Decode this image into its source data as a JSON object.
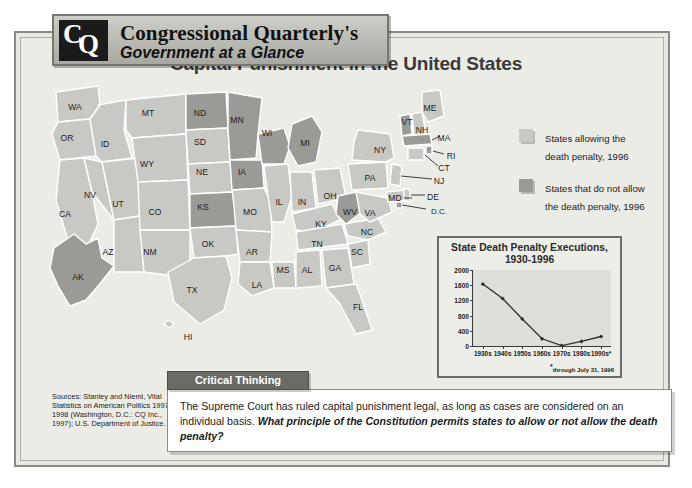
{
  "header": {
    "logo_c": "C",
    "logo_q": "Q",
    "line1": "Congressional Quarterly's",
    "line2": "Government at a Glance"
  },
  "main_title": "Capital Punishment in the United States",
  "legend": {
    "items": [
      {
        "swatch": "light",
        "text": "States allowing the death penalty, 1996",
        "color": "#c8c8c4"
      },
      {
        "swatch": "dark",
        "text": "States that do not allow the death penalty, 1996",
        "color": "#9a9a96"
      }
    ]
  },
  "map": {
    "allow_color": "#c8c8c4",
    "disallow_color": "#9a9a96",
    "border_color": "#ffffff",
    "states": [
      {
        "abbr": "WA",
        "x": 35,
        "y": 35,
        "penalty": "allow"
      },
      {
        "abbr": "OR",
        "x": 27,
        "y": 66,
        "penalty": "allow"
      },
      {
        "abbr": "CA",
        "x": 25,
        "y": 142,
        "penalty": "allow"
      },
      {
        "abbr": "ID",
        "x": 65,
        "y": 72,
        "penalty": "allow"
      },
      {
        "abbr": "NV",
        "x": 50,
        "y": 123,
        "penalty": "allow"
      },
      {
        "abbr": "UT",
        "x": 78,
        "y": 132,
        "penalty": "allow"
      },
      {
        "abbr": "AZ",
        "x": 68,
        "y": 180,
        "penalty": "allow"
      },
      {
        "abbr": "MT",
        "x": 108,
        "y": 41,
        "penalty": "allow"
      },
      {
        "abbr": "WY",
        "x": 107,
        "y": 92,
        "penalty": "allow"
      },
      {
        "abbr": "CO",
        "x": 115,
        "y": 140,
        "penalty": "allow"
      },
      {
        "abbr": "NM",
        "x": 110,
        "y": 180,
        "penalty": "allow"
      },
      {
        "abbr": "ND",
        "x": 160,
        "y": 41,
        "penalty": "disallow"
      },
      {
        "abbr": "SD",
        "x": 160,
        "y": 70,
        "penalty": "allow"
      },
      {
        "abbr": "NE",
        "x": 162,
        "y": 100,
        "penalty": "allow"
      },
      {
        "abbr": "KS",
        "x": 163,
        "y": 135,
        "penalty": "disallow"
      },
      {
        "abbr": "OK",
        "x": 168,
        "y": 172,
        "penalty": "allow"
      },
      {
        "abbr": "TX",
        "x": 152,
        "y": 218,
        "penalty": "allow"
      },
      {
        "abbr": "MN",
        "x": 197,
        "y": 48,
        "penalty": "disallow"
      },
      {
        "abbr": "IA",
        "x": 202,
        "y": 100,
        "penalty": "disallow"
      },
      {
        "abbr": "MO",
        "x": 210,
        "y": 140,
        "penalty": "allow"
      },
      {
        "abbr": "AR",
        "x": 212,
        "y": 180,
        "penalty": "allow"
      },
      {
        "abbr": "LA",
        "x": 217,
        "y": 213,
        "penalty": "allow"
      },
      {
        "abbr": "WI",
        "x": 227,
        "y": 61,
        "penalty": "disallow"
      },
      {
        "abbr": "IL",
        "x": 239,
        "y": 130,
        "penalty": "allow"
      },
      {
        "abbr": "MS",
        "x": 243,
        "y": 198,
        "penalty": "allow"
      },
      {
        "abbr": "MI",
        "x": 265,
        "y": 71,
        "penalty": "disallow"
      },
      {
        "abbr": "IN",
        "x": 262,
        "y": 130,
        "penalty": "allow"
      },
      {
        "abbr": "KY",
        "x": 281,
        "y": 152,
        "penalty": "allow"
      },
      {
        "abbr": "TN",
        "x": 277,
        "y": 172,
        "penalty": "allow"
      },
      {
        "abbr": "AL",
        "x": 267,
        "y": 198,
        "penalty": "allow"
      },
      {
        "abbr": "OH",
        "x": 290,
        "y": 124,
        "penalty": "allow"
      },
      {
        "abbr": "GA",
        "x": 295,
        "y": 196,
        "penalty": "allow"
      },
      {
        "abbr": "FL",
        "x": 318,
        "y": 235,
        "penalty": "allow"
      },
      {
        "abbr": "SC",
        "x": 317,
        "y": 180,
        "penalty": "allow"
      },
      {
        "abbr": "NC",
        "x": 327,
        "y": 160,
        "penalty": "allow"
      },
      {
        "abbr": "WV",
        "x": 310,
        "y": 140,
        "penalty": "disallow"
      },
      {
        "abbr": "VA",
        "x": 330,
        "y": 141,
        "penalty": "allow"
      },
      {
        "abbr": "PA",
        "x": 330,
        "y": 106,
        "penalty": "allow"
      },
      {
        "abbr": "NY",
        "x": 340,
        "y": 78,
        "penalty": "allow"
      },
      {
        "abbr": "VT",
        "x": 367,
        "y": 50,
        "penalty": "disallow"
      },
      {
        "abbr": "NH",
        "x": 382,
        "y": 58,
        "penalty": "allow"
      },
      {
        "abbr": "ME",
        "x": 390,
        "y": 36,
        "penalty": "allow"
      },
      {
        "abbr": "MA",
        "x": 404,
        "y": 66,
        "penalty": "disallow"
      },
      {
        "abbr": "RI",
        "x": 410,
        "y": 83,
        "penalty": "disallow"
      },
      {
        "abbr": "CT",
        "x": 404,
        "y": 95,
        "penalty": "allow"
      },
      {
        "abbr": "NJ",
        "x": 398,
        "y": 108,
        "penalty": "allow"
      },
      {
        "abbr": "MD",
        "x": 355,
        "y": 125,
        "penalty": "allow"
      },
      {
        "abbr": "DE",
        "x": 392,
        "y": 124,
        "penalty": "allow"
      },
      {
        "abbr": "D.C.",
        "x": 398,
        "y": 138,
        "penalty": "disallow"
      },
      {
        "abbr": "AK",
        "x": 38,
        "y": 205,
        "penalty": "disallow"
      },
      {
        "abbr": "HI",
        "x": 148,
        "y": 265,
        "penalty": "allow"
      }
    ]
  },
  "chart_data": {
    "type": "line",
    "title": "State Death Penalty Executions, 1930-1996",
    "title_line1": "State Death Penalty Executions,",
    "title_line2": "1930-1996",
    "categories": [
      "1930s",
      "1940s",
      "1950s",
      "1960s",
      "1970s",
      "1980s",
      "1990s"
    ],
    "values": [
      1630,
      1250,
      710,
      190,
      10,
      120,
      250
    ],
    "xlabel": "",
    "ylabel": "",
    "ylim": [
      0,
      2000
    ],
    "yticks": [
      0,
      400,
      800,
      1200,
      1600,
      2000
    ],
    "ytick_labels": [
      "0",
      "400",
      "800",
      "1200",
      "1600",
      "2000"
    ],
    "grid": false,
    "legend": "none",
    "line_color": "#2e2e2e",
    "marker": "diamond",
    "footnote": "through July 31, 1996",
    "footnote_marker": "*"
  },
  "sources": {
    "text": "Sources: Stanley and Niemi, Vital Statistics on American Politics 1997–1998 (Washington, D.C.: CQ Inc., 1997); U.S. Department of Justice."
  },
  "critical_thinking": {
    "tab_label": "Critical Thinking",
    "body_plain": "The Supreme Court has ruled capital punishment legal, as long as cases are considered on an individual basis.",
    "body_bold": "What principle of the Constitution permits states to allow or not allow the death penalty?"
  }
}
